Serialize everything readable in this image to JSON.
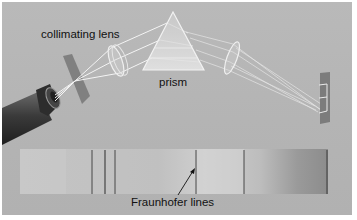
{
  "figure": {
    "labels": {
      "collimating_lens": "collimating lens",
      "prism": "prism",
      "fraunhofer_lines": "Fraunhofer lines"
    },
    "colors": {
      "background": "#b5b5b5",
      "border": "#ffffff",
      "text": "#111111",
      "spectrum_line": "#3a3a3a"
    },
    "spectrum": {
      "dark_line_positions_px": [
        92,
        105,
        115,
        196,
        244,
        327
      ]
    }
  }
}
